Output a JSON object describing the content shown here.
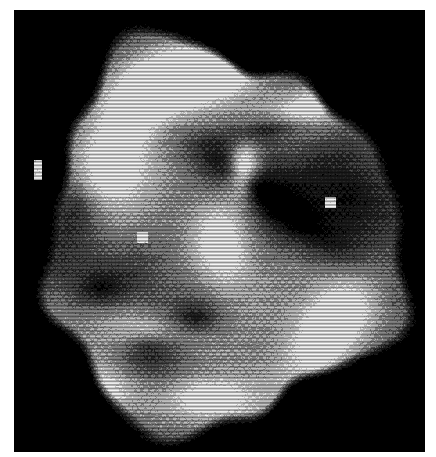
{
  "page": {
    "width": 436,
    "height": 457,
    "background_color": "#ffffff"
  },
  "frame": {
    "name": "black-field",
    "background_color": "#000000",
    "left": 14,
    "top": 10,
    "width": 411,
    "height": 442
  },
  "halftone": {
    "cell_width": 3.6,
    "cell_height": 3.6,
    "scanline_period": 3.6,
    "scanline_strength": 0.42,
    "dot_gain": 0.08,
    "noise": 0.055,
    "blur_px": 0.55,
    "levels": 5,
    "palette": [
      "#000000",
      "#2a2a2a",
      "#585858",
      "#8e8e8e",
      "#c8c8c8",
      "#f4f4f4"
    ]
  },
  "object": {
    "name": "irregular-galaxy-blob",
    "center_x": 218,
    "center_y": 238,
    "radius_x": 182,
    "radius_y": 196,
    "edge_softness": 0.06,
    "rotation_deg": -12
  },
  "chart_data": {
    "type": "heatmap",
    "title": "",
    "xlabel": "",
    "ylabel": "",
    "grid": false,
    "legend": "none",
    "value_range": [
      0.0,
      1.0
    ],
    "colormap": "grayscale",
    "note": "Intensity field rendered as a 5-level halftone. Features listed below are the visually distinguishable bright and dark regions of the plate.",
    "features": [
      {
        "id": "bright-arc-north",
        "label": "upper-left bright ridge",
        "cx": 150,
        "cy": 95,
        "rx": 62,
        "ry": 42,
        "rot": -28,
        "value": 1.0,
        "falloff": 1.6
      },
      {
        "id": "bright-arc-north2",
        "label": "upper bright plateau",
        "cx": 205,
        "cy": 72,
        "rx": 52,
        "ry": 26,
        "rot": -6,
        "value": 0.98,
        "falloff": 1.7
      },
      {
        "id": "bright-limb-northeast",
        "label": "north-east bright limb",
        "cx": 312,
        "cy": 108,
        "rx": 70,
        "ry": 26,
        "rot": -14,
        "value": 0.94,
        "falloff": 1.5
      },
      {
        "id": "bright-stream-west",
        "label": "west bright stream",
        "cx": 110,
        "cy": 168,
        "rx": 44,
        "ry": 54,
        "rot": 22,
        "value": 0.92,
        "falloff": 1.5
      },
      {
        "id": "bright-core-knot",
        "label": "central bright knot",
        "cx": 243,
        "cy": 170,
        "rx": 17,
        "ry": 30,
        "rot": 4,
        "value": 1.0,
        "falloff": 1.8
      },
      {
        "id": "bright-bar-center",
        "label": "central elongated bar",
        "cx": 222,
        "cy": 247,
        "rx": 38,
        "ry": 62,
        "rot": -8,
        "value": 0.82,
        "falloff": 1.4
      },
      {
        "id": "bright-limb-southeast",
        "label": "south-east bright limb",
        "cx": 330,
        "cy": 330,
        "rx": 42,
        "ry": 78,
        "rot": 34,
        "value": 1.0,
        "falloff": 1.4
      },
      {
        "id": "bright-band-south",
        "label": "southern bright band",
        "cx": 150,
        "cy": 330,
        "rx": 72,
        "ry": 30,
        "rot": 8,
        "value": 0.84,
        "falloff": 1.4
      },
      {
        "id": "bright-patch-southwest",
        "label": "south-west bright patch",
        "cx": 100,
        "cy": 390,
        "rx": 54,
        "ry": 30,
        "rot": 4,
        "value": 0.8,
        "falloff": 1.4
      },
      {
        "id": "bright-patch-south2",
        "label": "south bright patch",
        "cx": 210,
        "cy": 398,
        "rx": 48,
        "ry": 24,
        "rot": -4,
        "value": 0.78,
        "falloff": 1.4
      },
      {
        "id": "dark-lane-diagonal",
        "label": "dark dust lane (NE-SW)",
        "cx": 268,
        "cy": 196,
        "rx": 96,
        "ry": 20,
        "rot": 36,
        "value": -0.72,
        "falloff": 1.4
      },
      {
        "id": "dark-lane-upper",
        "label": "upper dark lane",
        "cx": 270,
        "cy": 128,
        "rx": 64,
        "ry": 16,
        "rot": -10,
        "value": -0.52,
        "falloff": 1.5
      },
      {
        "id": "dark-region-east",
        "label": "eastern dark region",
        "cx": 348,
        "cy": 196,
        "rx": 58,
        "ry": 58,
        "rot": 0,
        "value": -0.46,
        "falloff": 1.3
      },
      {
        "id": "dark-blob-center",
        "label": "central dark blob",
        "cx": 148,
        "cy": 345,
        "rx": 46,
        "ry": 36,
        "rot": 10,
        "value": -0.58,
        "falloff": 1.4
      },
      {
        "id": "dark-blob-southwest",
        "label": "south-west dark blob",
        "cx": 100,
        "cy": 288,
        "rx": 34,
        "ry": 24,
        "rot": 0,
        "value": -0.4,
        "falloff": 1.4
      },
      {
        "id": "dark-notch-south",
        "label": "southern dark notch",
        "cx": 196,
        "cy": 318,
        "rx": 30,
        "ry": 18,
        "rot": 0,
        "value": -0.44,
        "falloff": 1.4
      },
      {
        "id": "dark-wedge-west",
        "label": "western dark wedge",
        "cx": 78,
        "cy": 208,
        "rx": 36,
        "ry": 50,
        "rot": -10,
        "value": -0.34,
        "falloff": 1.3
      }
    ],
    "specks": [
      {
        "id": "speck-far-west",
        "label": "isolated speck (outside envelope, west)",
        "x": 34,
        "y": 160,
        "w": 8,
        "h": 20,
        "value": 1.0
      },
      {
        "id": "speck-west-inner",
        "label": "small bright speck, inner west",
        "x": 137,
        "y": 232,
        "w": 11,
        "h": 11,
        "value": 1.0
      },
      {
        "id": "speck-east-inner",
        "label": "small bright speck, inner east",
        "x": 325,
        "y": 197,
        "w": 11,
        "h": 11,
        "value": 1.0
      }
    ]
  }
}
